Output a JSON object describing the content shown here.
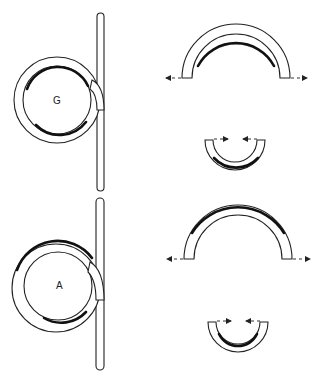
{
  "figure": {
    "panels": [
      {
        "id": "G",
        "label": "G",
        "description": "Coiled wire (spring) with straight shank; inner surface of coil heavily shaded",
        "arch": {
          "shaded": "inner",
          "force_direction": "outward"
        },
        "cup": {
          "shaded": "outer",
          "force_direction": "inward"
        }
      },
      {
        "id": "A",
        "label": "A",
        "description": "Coiled wire (spring) with straight shank; outer surface of coil heavily shaded",
        "arch": {
          "shaded": "outer",
          "force_direction": "outward"
        },
        "cup": {
          "shaded": "inner",
          "force_direction": "inward"
        }
      }
    ],
    "colors": {
      "line": "#222222",
      "background": "#ffffff"
    }
  }
}
